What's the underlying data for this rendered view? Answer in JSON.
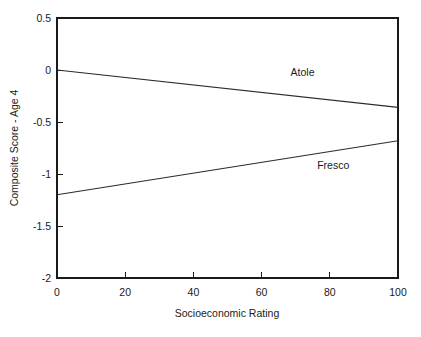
{
  "chart_data": {
    "type": "line",
    "title": "",
    "xlabel": "Socioeconomic Rating",
    "ylabel": "Composite Score - Age 4",
    "xlim": [
      0,
      100
    ],
    "ylim": [
      -2,
      0.5
    ],
    "xticks": [
      "0",
      "20",
      "40",
      "60",
      "80",
      "100"
    ],
    "xtick_values": [
      0,
      20,
      40,
      60,
      80,
      100
    ],
    "yticks": [
      "0.5",
      "0",
      "-0.5",
      "-1",
      "-1.5",
      "-2"
    ],
    "ytick_values": [
      0.5,
      0,
      -0.5,
      -1,
      -1.5,
      -2
    ],
    "grid": false,
    "legend_position": "inline-annotation",
    "x": [
      0,
      100
    ],
    "series": [
      {
        "name": "Atole",
        "values": [
          0.0,
          -0.36
        ],
        "label_x": 72,
        "label_y": -0.06
      },
      {
        "name": "Fresco",
        "values": [
          -1.2,
          -0.68
        ],
        "label_x": 81,
        "label_y": -0.95
      }
    ],
    "annotations": [
      {
        "text": "Atole",
        "x": 72,
        "y": -0.06
      },
      {
        "text": "Fresco",
        "x": 81,
        "y": -0.95
      }
    ]
  },
  "axes": {
    "x_title": "Socioeconomic Rating",
    "y_title": "Composite Score - Age 4",
    "x_tick_labels": [
      "0",
      "20",
      "40",
      "60",
      "80",
      "100"
    ],
    "y_tick_labels": [
      "0.5",
      "0",
      "-0.5",
      "-1",
      "-1.5",
      "-2"
    ]
  },
  "colors": {
    "background": "#ffffff",
    "axis": "#1a1a1a",
    "line": "#2b2b2b",
    "text": "#1a1a1a"
  }
}
